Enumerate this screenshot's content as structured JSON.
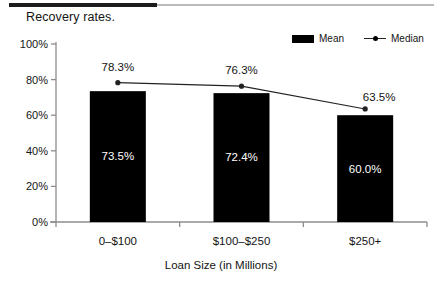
{
  "document": {
    "title": "Recovery rates.",
    "rule_dark_color": "#1c1c1c",
    "rule_light_color": "#b9b9b9"
  },
  "legend": {
    "position": "top-right",
    "entries": [
      {
        "label": "Mean",
        "marker": "filled-rect-swatch",
        "color": "#000000"
      },
      {
        "label": "Median",
        "marker": "line-with-dot-swatch",
        "color": "#222222"
      }
    ]
  },
  "chart_data": {
    "type": "bar",
    "title": "Recovery rates.",
    "xlabel": "Loan Size  (in Millions)",
    "ylabel": "",
    "categories": [
      "0–$100",
      "$100–$250",
      "$250+"
    ],
    "ylim": [
      0,
      100
    ],
    "ytick_labels": [
      "0%",
      "20%",
      "40%",
      "60%",
      "80%",
      "100%"
    ],
    "ytick_values": [
      0,
      20,
      40,
      60,
      80,
      100
    ],
    "grid": false,
    "legend_position": "top-right",
    "series": [
      {
        "name": "Mean",
        "type": "bar",
        "color": "#000000",
        "values": [
          73.5,
          72.4,
          60.0
        ],
        "labels": [
          "73.5%",
          "72.4%",
          "60.0%"
        ],
        "label_color": "#ffffff"
      },
      {
        "name": "Median",
        "type": "line",
        "color": "#222222",
        "values": [
          78.3,
          76.3,
          63.5
        ],
        "labels": [
          "78.3%",
          "76.3%",
          "63.5%"
        ],
        "label_color": "#141414"
      }
    ]
  }
}
